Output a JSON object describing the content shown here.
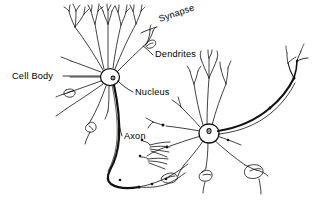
{
  "figure": {
    "type": "biological-diagram",
    "background_color": "#ffffff",
    "ink_color": "#000000",
    "width": 320,
    "height": 206
  },
  "labels": [
    {
      "id": "synapse",
      "text": "Synapse",
      "x": 160,
      "y": 22,
      "rotation": -19,
      "anchor": "start"
    },
    {
      "id": "dendrites",
      "text": "Dendrites",
      "x": 155,
      "y": 57,
      "rotation": 0,
      "anchor": "start"
    },
    {
      "id": "cell_body",
      "text": "Cell Body",
      "x": 12,
      "y": 79,
      "rotation": 0,
      "anchor": "start"
    },
    {
      "id": "nucleus",
      "text": "Nucleus",
      "x": 135,
      "y": 95,
      "rotation": 0,
      "anchor": "start"
    },
    {
      "id": "axon",
      "text": "Axon",
      "x": 124,
      "y": 139,
      "rotation": 0,
      "anchor": "start"
    }
  ],
  "structures": {
    "soma_left": {
      "cx": 110,
      "cy": 77,
      "rx": 9.5,
      "ry": 8.5,
      "nucleus_cx": 113,
      "nucleus_cy": 78,
      "nucleus_r": 1.9
    },
    "soma_right": {
      "cx": 209,
      "cy": 133,
      "rx": 9.5,
      "ry": 9.0,
      "nucleus_cx": 209,
      "nucleus_cy": 131,
      "nucleus_r": 2.0
    },
    "neuron_count": 2,
    "dendrite_count_left": 11,
    "dendrite_count_right": 10
  }
}
